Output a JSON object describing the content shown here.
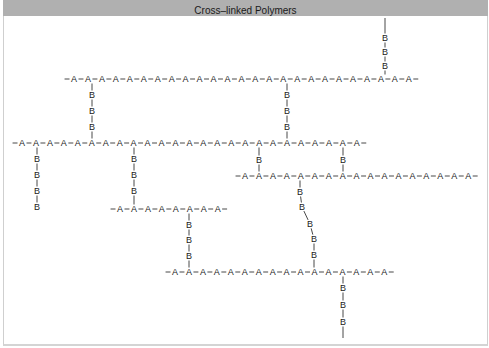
{
  "title": "Cross–linked Polymers",
  "monomer_a": "A",
  "monomer_b": "B",
  "colors": {
    "header_bg": "#b0b0b0",
    "ink": "#1a1a1a",
    "bg": "#ffffff"
  },
  "spacing": 13.95,
  "chains": [
    {
      "id": "chain-1",
      "y": 79,
      "x0": 74,
      "count": 25
    },
    {
      "id": "chain-2",
      "y": 143,
      "x0": 22,
      "count": 25
    },
    {
      "id": "chain-3",
      "y": 176,
      "x0": 245,
      "count": 17
    },
    {
      "id": "chain-4",
      "y": 209,
      "x0": 120,
      "count": 8
    },
    {
      "id": "chain-5",
      "y": 272,
      "x0": 175,
      "count": 16
    }
  ],
  "crosslinks": [
    {
      "id": "link-top-right",
      "points": [
        [
          385,
          79
        ],
        [
          385,
          66
        ],
        [
          385,
          52
        ],
        [
          385,
          38
        ]
      ],
      "b_count": 3,
      "open_end": [
        385,
        18
      ]
    },
    {
      "id": "link-c1-c2-left",
      "points": [
        [
          92,
          79
        ],
        [
          92,
          95
        ],
        [
          92,
          111
        ],
        [
          92,
          127
        ],
        [
          92,
          143
        ]
      ],
      "b_count": 3
    },
    {
      "id": "link-c1-c2-right",
      "points": [
        [
          287,
          79
        ],
        [
          287,
          95
        ],
        [
          287,
          111
        ],
        [
          287,
          127
        ],
        [
          287,
          143
        ]
      ],
      "b_count": 3
    },
    {
      "id": "link-c2-dangling",
      "points": [
        [
          37,
          143
        ],
        [
          37,
          159
        ],
        [
          37,
          175
        ],
        [
          37,
          191
        ],
        [
          37,
          207
        ]
      ],
      "b_count": 4
    },
    {
      "id": "link-c2-c4",
      "points": [
        [
          134,
          143
        ],
        [
          134,
          159
        ],
        [
          134,
          175
        ],
        [
          134,
          191
        ],
        [
          134,
          209
        ]
      ],
      "b_count": 3
    },
    {
      "id": "link-c2-c3-left",
      "points": [
        [
          259,
          143
        ],
        [
          259,
          160
        ],
        [
          259,
          176
        ]
      ],
      "b_count": 1
    },
    {
      "id": "link-c2-c3-right",
      "points": [
        [
          343,
          143
        ],
        [
          343,
          160
        ],
        [
          343,
          176
        ]
      ],
      "b_count": 1
    },
    {
      "id": "link-c3-c5-zigzag",
      "points": [
        [
          300,
          176
        ],
        [
          300,
          192
        ],
        [
          302,
          207
        ],
        [
          310,
          224
        ],
        [
          314,
          239
        ],
        [
          314,
          255
        ],
        [
          314,
          272
        ]
      ],
      "b_count": 5
    },
    {
      "id": "link-c4-c5",
      "points": [
        [
          189,
          209
        ],
        [
          189,
          225
        ],
        [
          189,
          240
        ],
        [
          189,
          256
        ],
        [
          189,
          272
        ]
      ],
      "b_count": 3
    },
    {
      "id": "link-c5-dangling",
      "points": [
        [
          343,
          272
        ],
        [
          343,
          288
        ],
        [
          343,
          305
        ],
        [
          343,
          322
        ]
      ],
      "b_count": 3,
      "open_end": [
        343,
        338
      ]
    }
  ]
}
